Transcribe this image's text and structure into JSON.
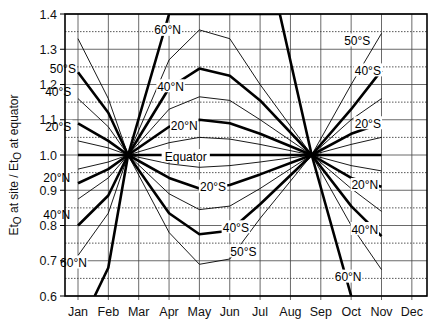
{
  "chart_data": {
    "type": "line",
    "title": "",
    "xlabel": "",
    "ylabel": "Et0 at site / Et0 at equator",
    "ylabel_parts": {
      "a": "Et",
      "a_sub": "O",
      "b": " at site / Et",
      "b_sub": "O",
      "c": " at equator"
    },
    "categories": [
      "Jan",
      "Feb",
      "Mar",
      "Apr",
      "May",
      "Jun",
      "Jul",
      "Aug",
      "Sep",
      "Oct",
      "Nov",
      "Dec"
    ],
    "ylim": [
      0.6,
      1.4
    ],
    "yticks": [
      0.6,
      0.7,
      0.8,
      0.9,
      1.0,
      1.1,
      1.2,
      1.3,
      1.4
    ],
    "ytick_labels": [
      "0.6",
      "0.7",
      "0.8",
      "0.9",
      "1.0",
      "1.1",
      "1.2",
      "1.3",
      "1.4"
    ],
    "grid": {
      "solid_major": true,
      "dotted_minor": true
    },
    "convergence_points": [
      {
        "month": 2.65,
        "value": 1.0
      },
      {
        "month": 8.7,
        "value": 1.0
      }
    ],
    "series": [
      {
        "name": "60°N",
        "weight": "thick",
        "label": "60°N",
        "points": [
          [
            1.55,
            0.6
          ],
          [
            2.0,
            0.68
          ],
          [
            2.65,
            1.0
          ],
          [
            4.0,
            1.4
          ],
          [
            7.65,
            1.4
          ],
          [
            8.7,
            1.0
          ],
          [
            10.0,
            0.6
          ]
        ]
      },
      {
        "name": "50°N",
        "weight": "thin",
        "label": "",
        "points": [
          [
            1.0,
            0.715
          ],
          [
            2.0,
            0.835
          ],
          [
            2.65,
            1.0
          ],
          [
            4.0,
            1.27
          ],
          [
            5.0,
            1.355
          ],
          [
            6.0,
            1.33
          ],
          [
            7.0,
            1.2
          ],
          [
            8.7,
            1.0
          ],
          [
            10.0,
            0.8
          ],
          [
            11.0,
            0.675
          ]
        ]
      },
      {
        "name": "40°N",
        "weight": "thick",
        "label": "40°N",
        "points": [
          [
            1.0,
            0.8
          ],
          [
            2.0,
            0.885
          ],
          [
            2.65,
            1.0
          ],
          [
            4.0,
            1.19
          ],
          [
            5.0,
            1.245
          ],
          [
            6.0,
            1.225
          ],
          [
            7.0,
            1.155
          ],
          [
            8.7,
            1.0
          ],
          [
            10.0,
            0.855
          ],
          [
            11.0,
            0.77
          ]
        ]
      },
      {
        "name": "30°N",
        "weight": "thin",
        "label": "",
        "points": [
          [
            1.0,
            0.875
          ],
          [
            2.0,
            0.935
          ],
          [
            2.65,
            1.0
          ],
          [
            4.0,
            1.13
          ],
          [
            5.0,
            1.165
          ],
          [
            6.0,
            1.155
          ],
          [
            7.0,
            1.1
          ],
          [
            8.7,
            1.0
          ],
          [
            10.0,
            0.905
          ],
          [
            11.0,
            0.84
          ]
        ]
      },
      {
        "name": "20°N",
        "weight": "thick",
        "label": "20°N",
        "points": [
          [
            1.0,
            0.92
          ],
          [
            2.0,
            0.96
          ],
          [
            2.65,
            1.0
          ],
          [
            4.0,
            1.08
          ],
          [
            5.0,
            1.1
          ],
          [
            6.0,
            1.09
          ],
          [
            7.0,
            1.06
          ],
          [
            8.7,
            1.0
          ],
          [
            10.0,
            0.935
          ],
          [
            11.0,
            0.91
          ]
        ]
      },
      {
        "name": "10°N",
        "weight": "thin",
        "label": "",
        "points": [
          [
            1.0,
            0.96
          ],
          [
            2.0,
            0.98
          ],
          [
            2.65,
            1.0
          ],
          [
            4.0,
            1.035
          ],
          [
            5.0,
            1.05
          ],
          [
            6.0,
            1.045
          ],
          [
            7.0,
            1.03
          ],
          [
            8.7,
            1.0
          ],
          [
            10.0,
            0.97
          ],
          [
            11.0,
            0.955
          ]
        ]
      },
      {
        "name": "Equator",
        "weight": "thick",
        "label": "Equator",
        "points": [
          [
            1.0,
            1.0
          ],
          [
            11.0,
            1.0
          ]
        ]
      },
      {
        "name": "10°S",
        "weight": "thin",
        "label": "",
        "points": [
          [
            1.0,
            1.04
          ],
          [
            2.0,
            1.02
          ],
          [
            2.65,
            1.0
          ],
          [
            4.0,
            0.975
          ],
          [
            5.0,
            0.965
          ],
          [
            6.0,
            0.97
          ],
          [
            7.0,
            0.98
          ],
          [
            8.7,
            1.0
          ],
          [
            10.0,
            1.03
          ],
          [
            11.0,
            1.05
          ]
        ]
      },
      {
        "name": "20°S",
        "weight": "thick",
        "label": "20°S",
        "points": [
          [
            1.0,
            1.09
          ],
          [
            2.0,
            1.04
          ],
          [
            2.65,
            1.0
          ],
          [
            4.0,
            0.935
          ],
          [
            5.0,
            0.905
          ],
          [
            6.0,
            0.915
          ],
          [
            7.0,
            0.945
          ],
          [
            8.7,
            1.0
          ],
          [
            10.0,
            1.06
          ],
          [
            11.0,
            1.09
          ]
        ]
      },
      {
        "name": "30°S",
        "weight": "thin",
        "label": "",
        "points": [
          [
            1.0,
            1.16
          ],
          [
            2.0,
            1.08
          ],
          [
            2.65,
            1.0
          ],
          [
            4.0,
            0.89
          ],
          [
            5.0,
            0.845
          ],
          [
            6.0,
            0.855
          ],
          [
            7.0,
            0.905
          ],
          [
            8.7,
            1.0
          ],
          [
            10.0,
            1.1
          ],
          [
            11.0,
            1.16
          ]
        ]
      },
      {
        "name": "40°S",
        "weight": "thick",
        "label": "40°S",
        "points": [
          [
            1.0,
            1.235
          ],
          [
            2.0,
            1.12
          ],
          [
            2.65,
            1.0
          ],
          [
            4.0,
            0.835
          ],
          [
            5.0,
            0.775
          ],
          [
            6.0,
            0.785
          ],
          [
            7.0,
            0.86
          ],
          [
            8.7,
            1.0
          ],
          [
            10.0,
            1.13
          ],
          [
            11.0,
            1.24
          ]
        ]
      },
      {
        "name": "50°S",
        "weight": "thin",
        "label": "50°S",
        "points": [
          [
            1.0,
            1.33
          ],
          [
            2.0,
            1.16
          ],
          [
            2.65,
            1.0
          ],
          [
            4.0,
            0.78
          ],
          [
            5.0,
            0.69
          ],
          [
            6.0,
            0.705
          ],
          [
            7.0,
            0.82
          ],
          [
            8.7,
            1.0
          ],
          [
            10.0,
            1.2
          ],
          [
            11.0,
            1.345
          ]
        ]
      }
    ],
    "annotations": [
      {
        "text": "60°N",
        "month": 3.95,
        "value": 1.355
      },
      {
        "text": "40°N",
        "month": 4.05,
        "value": 1.195
      },
      {
        "text": "20°N",
        "month": 4.5,
        "value": 1.085
      },
      {
        "text": "Equator",
        "month": 4.55,
        "value": 0.997
      },
      {
        "text": "20°S",
        "month": 5.45,
        "value": 0.91
      },
      {
        "text": "40°S",
        "month": 6.2,
        "value": 0.795
      },
      {
        "text": "50°S",
        "month": 6.45,
        "value": 0.727
      },
      {
        "text": "50°S",
        "month": 0.5,
        "value": 1.245
      },
      {
        "text": "40°S",
        "month": 0.35,
        "value": 1.18
      },
      {
        "text": "20°S",
        "month": 0.35,
        "value": 1.08
      },
      {
        "text": "20°N",
        "month": 0.3,
        "value": 0.935
      },
      {
        "text": "40°N",
        "month": 0.3,
        "value": 0.83
      },
      {
        "text": "60°N",
        "month": 0.85,
        "value": 0.695
      },
      {
        "text": "50°S",
        "month": 10.2,
        "value": 1.325
      },
      {
        "text": "40°S",
        "month": 10.55,
        "value": 1.24
      },
      {
        "text": "20°S",
        "month": 10.55,
        "value": 1.09
      },
      {
        "text": "20°N",
        "month": 10.45,
        "value": 0.915
      },
      {
        "text": "40°N",
        "month": 10.45,
        "value": 0.79
      },
      {
        "text": "60°N",
        "month": 9.9,
        "value": 0.655
      }
    ]
  },
  "layout": {
    "plot_left": 65,
    "plot_right": 427,
    "plot_top": 14,
    "plot_bottom": 296,
    "jan_x": 78,
    "month_step": 30.35
  }
}
